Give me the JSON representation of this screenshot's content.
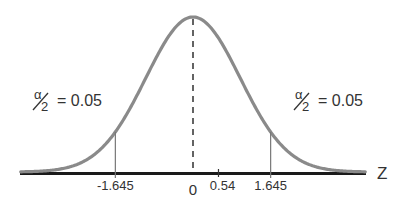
{
  "diagram": {
    "type": "normal-distribution",
    "axis_label": "Z",
    "mean": 0,
    "critical_values": [
      -1.645,
      1.645
    ],
    "test_statistic": 0.54,
    "tick_labels": {
      "left_critical": "-1.645",
      "zero": "0",
      "test_stat": "0.54",
      "right_critical": "1.645"
    },
    "tails": {
      "left": {
        "numerator": "α",
        "denominator": "2",
        "value_text": "= 0.05"
      },
      "right": {
        "numerator": "α",
        "denominator": "2",
        "value_text": "= 0.05"
      }
    },
    "colors": {
      "curve": "#8a8a8a",
      "axis": "#1a1a1a",
      "critical_line": "#777777",
      "center_line": "#222222",
      "text": "#333333"
    }
  },
  "chart_data": {
    "type": "line",
    "title": "",
    "xlabel": "Z",
    "ylabel": "",
    "xlim": [
      -3.6,
      3.6
    ],
    "series": [
      {
        "name": "standard normal density",
        "mean": 0,
        "sd": 1
      }
    ],
    "annotations": [
      {
        "x": -1.645,
        "text": "-1.645",
        "kind": "critical-value"
      },
      {
        "x": 1.645,
        "text": "1.645",
        "kind": "critical-value"
      },
      {
        "x": 0,
        "text": "0",
        "kind": "mean"
      },
      {
        "x": 0.54,
        "text": "0.54",
        "kind": "test-statistic"
      },
      {
        "region": "left-tail",
        "text": "α/2 = 0.05"
      },
      {
        "region": "right-tail",
        "text": "α/2 = 0.05"
      }
    ],
    "grid": false,
    "legend": "none"
  }
}
